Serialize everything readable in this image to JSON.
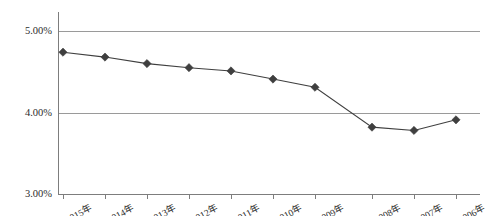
{
  "chart_data": {
    "type": "line",
    "title": "",
    "xlabel": "",
    "ylabel": "",
    "categories": [
      "2015年",
      "2014年",
      "2013年",
      "2012年",
      "2011年",
      "2010年",
      "2009年",
      "2008年",
      "2007年",
      "2006年"
    ],
    "values": [
      4.74,
      4.68,
      4.6,
      4.55,
      4.51,
      4.41,
      4.31,
      3.82,
      3.78,
      3.91
    ],
    "value_labels": [
      "4.74%",
      "4.68%",
      "4.60%",
      "4.55%",
      "4.51%",
      "4.41%",
      "4.31%",
      "3.82%",
      "3.78%",
      "3.91%"
    ],
    "ylim": [
      3.0,
      5.0
    ],
    "yticks": [
      3.0,
      4.0,
      5.0
    ],
    "ytick_labels": [
      "3.00%",
      "4.00%",
      "5.00%"
    ],
    "grid": true,
    "legend": false,
    "marker": "diamond",
    "series_color": "#3f3f3f",
    "grid_color": "#9a9a9a",
    "axis_color": "#7d7d7d",
    "series": [
      {
        "name": "",
        "values": [
          4.74,
          4.68,
          4.6,
          4.55,
          4.51,
          4.41,
          4.31,
          3.82,
          3.78,
          3.91
        ]
      }
    ]
  },
  "axes": {
    "y_tick_labels": [
      "5.00%",
      "4.00%",
      "3.00%"
    ],
    "x_tick_labels": [
      "2015年",
      "2014年",
      "2013年",
      "2012年",
      "2011年",
      "2010年",
      "2009年",
      "2008年",
      "2007年",
      "2006年"
    ]
  }
}
